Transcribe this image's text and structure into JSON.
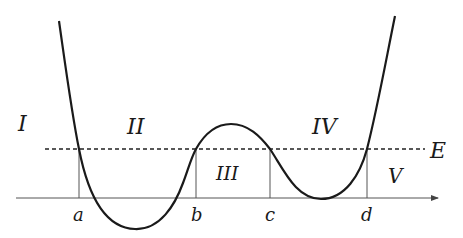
{
  "diagram": {
    "type": "potential-energy-curve",
    "regions": [
      {
        "label": "I",
        "x": 18,
        "y": 131
      },
      {
        "label": "II",
        "x": 127,
        "y": 134
      },
      {
        "label": "III",
        "x": 216,
        "y": 180
      },
      {
        "label": "IV",
        "x": 312,
        "y": 134
      },
      {
        "label": "V",
        "x": 388,
        "y": 183
      }
    ],
    "turning_points": [
      {
        "label": "a",
        "x": 79
      },
      {
        "label": "b",
        "x": 196
      },
      {
        "label": "c",
        "x": 270
      },
      {
        "label": "d",
        "x": 367
      }
    ],
    "energy_label": "E",
    "energy_level_y": 149,
    "axis_y": 198,
    "colors": {
      "curve": "#1a1a1a",
      "axis": "#444444",
      "dashed": "#222222"
    }
  }
}
